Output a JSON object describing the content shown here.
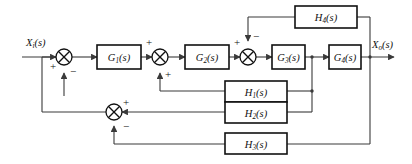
{
  "diagram": {
    "type": "block-diagram",
    "canvas": {
      "width": 412,
      "height": 164
    },
    "colors": {
      "line": "#3a3a3a",
      "block_border": "#111111",
      "text": "#111111",
      "background": "#ffffff"
    },
    "signals": {
      "input": {
        "label": "X",
        "sub": "i",
        "suffix": "(s)"
      },
      "output": {
        "label": "X",
        "sub": "o",
        "suffix": "(s)"
      }
    },
    "forward_blocks": [
      {
        "id": "G1",
        "label": "G",
        "sub": "1",
        "suffix": "(s)"
      },
      {
        "id": "G2",
        "label": "G",
        "sub": "2",
        "suffix": "(s)"
      },
      {
        "id": "G3",
        "label": "G",
        "sub": "3",
        "suffix": "(s)"
      },
      {
        "id": "G4",
        "label": "G",
        "sub": "4",
        "suffix": "(s)"
      }
    ],
    "feedback_blocks": [
      {
        "id": "H4",
        "label": "H",
        "sub": "4",
        "suffix": "(s)"
      },
      {
        "id": "H1",
        "label": "H",
        "sub": "1",
        "suffix": "(s)"
      },
      {
        "id": "H2",
        "label": "H",
        "sub": "2",
        "suffix": "(s)"
      },
      {
        "id": "H3",
        "label": "H",
        "sub": "3",
        "suffix": "(s)"
      }
    ],
    "summing_junctions": [
      {
        "id": "S1",
        "signs": {
          "left": "+",
          "bottom": "−"
        }
      },
      {
        "id": "S2",
        "signs": {
          "left": "+",
          "bottom": "+"
        }
      },
      {
        "id": "S3",
        "signs": {
          "left": "+",
          "top": "−"
        }
      },
      {
        "id": "S4",
        "signs": {
          "right": "+",
          "bottom": "−"
        }
      }
    ],
    "signs": {
      "s1_left": "+",
      "s1_bottom": "−",
      "s2_left": "+",
      "s2_bottom": "+",
      "s3_left": "+",
      "s3_top": "−",
      "s4_right": "+",
      "s4_bottom": "−"
    }
  }
}
